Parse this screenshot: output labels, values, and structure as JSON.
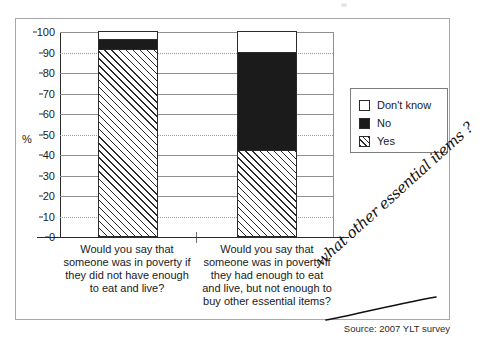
{
  "source_note": "Source: 2007 YLT survey",
  "annotation": {
    "handwritten_text": "what other essential items ?"
  },
  "legend": {
    "position": "right",
    "items": [
      {
        "label": "Don't know",
        "swatch": "white-square-icon"
      },
      {
        "label": "No",
        "swatch": "black-square-icon"
      },
      {
        "label": "Yes",
        "swatch": "hatched-square-icon"
      }
    ]
  },
  "axis": {
    "y_unit_label": "%",
    "y_ticks": [
      "0",
      "10",
      "20",
      "30",
      "40",
      "50",
      "60",
      "70",
      "80",
      "90",
      "100"
    ]
  },
  "chart_data": {
    "type": "bar",
    "subtype": "stacked-bar-100",
    "title": "",
    "xlabel": "",
    "ylabel": "%",
    "ylim": [
      0,
      100
    ],
    "grid": true,
    "legend_position": "right",
    "categories": [
      "Would you say that someone was in poverty if they did not have enough to eat and live?",
      "Would you say that someone was in poverty if they had enough to eat and live, but not enough to buy other essential items?"
    ],
    "series": [
      {
        "name": "Yes",
        "values": [
          91,
          42
        ],
        "color": "#ffffff",
        "pattern": "diagonal-hatch"
      },
      {
        "name": "No",
        "values": [
          5,
          48
        ],
        "color": "#1b1b1b",
        "pattern": "solid"
      },
      {
        "name": "Don't know",
        "values": [
          4,
          10
        ],
        "color": "#ffffff",
        "pattern": "none"
      }
    ],
    "stack_order_bottom_to_top": [
      "Yes",
      "No",
      "Don't know"
    ],
    "source": "Source: 2007 YLT survey"
  }
}
